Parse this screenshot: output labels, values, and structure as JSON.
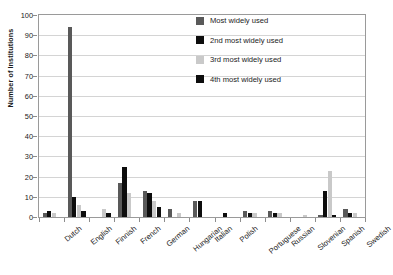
{
  "chart_data": {
    "type": "bar",
    "title": "",
    "xlabel": "",
    "ylabel": "Number of Institutions",
    "ylim": [
      0,
      100
    ],
    "ytick_step": 10,
    "yticks": [
      0,
      10,
      20,
      30,
      40,
      50,
      60,
      70,
      80,
      90,
      100
    ],
    "grid": true,
    "legend_position": "top-right",
    "categories": [
      "Dutch",
      "English",
      "Finnish",
      "French",
      "German",
      "Hungarian",
      "Italian",
      "Polish",
      "Portuguese",
      "Russian",
      "Slovenian",
      "Spanish",
      "Swedish"
    ],
    "series": [
      {
        "name": "Most widely used",
        "color": "#595959",
        "values": [
          2,
          94,
          0,
          17,
          13,
          4,
          8,
          0,
          3,
          3,
          0,
          1,
          4
        ]
      },
      {
        "name": "2nd most widely used",
        "color": "#0d0d0d",
        "values": [
          3,
          10,
          0,
          25,
          12,
          0,
          8,
          2,
          2,
          2,
          0,
          13,
          2
        ]
      },
      {
        "name": "3rd most widely used",
        "color": "#c9c9c9",
        "values": [
          2,
          6,
          4,
          12,
          8,
          2,
          0,
          0,
          2,
          2,
          1,
          23,
          2
        ]
      },
      {
        "name": "4th most widely used",
        "color": "#0d0d0d",
        "values": [
          0,
          3,
          2,
          0,
          5,
          0,
          0,
          0,
          0,
          0,
          0,
          1,
          0
        ]
      }
    ]
  },
  "legend": {
    "items": [
      {
        "label": "Most widely used",
        "color": "#595959"
      },
      {
        "label": "2nd most widely used",
        "color": "#0d0d0d"
      },
      {
        "label": "3rd most widely used",
        "color": "#c9c9c9"
      },
      {
        "label": "4th most widely used",
        "color": "#0d0d0d"
      }
    ]
  }
}
